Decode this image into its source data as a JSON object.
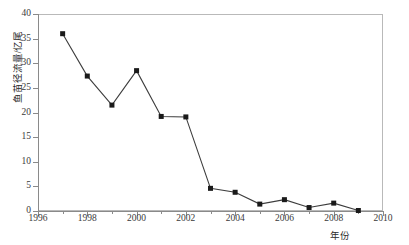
{
  "chart_data": {
    "type": "line",
    "title": "",
    "xlabel": "年份",
    "ylabel": "鱼苗径流量/亿尾",
    "xlim": [
      1996,
      2010
    ],
    "ylim": [
      0,
      40
    ],
    "grid": false,
    "legend": null,
    "marker": "square",
    "line_color": "#3d3d3d",
    "marker_color": "#1a1a1a",
    "x": [
      1997,
      1998,
      1999,
      2000,
      2001,
      2002,
      2003,
      2004,
      2005,
      2006,
      2007,
      2008,
      2009
    ],
    "values": [
      36.0,
      27.4,
      21.5,
      28.5,
      19.2,
      19.1,
      4.6,
      3.8,
      1.4,
      2.3,
      0.7,
      1.6,
      0.1
    ],
    "xticks": [
      1996,
      1998,
      2000,
      2002,
      2004,
      2006,
      2008,
      2010
    ],
    "xtick_labels": [
      "1996",
      "1998",
      "2000",
      "2002",
      "2004",
      "2006",
      "2008",
      "2010"
    ],
    "xticks_minor": [
      1997,
      1999,
      2001,
      2003,
      2005,
      2007,
      2009
    ],
    "yticks": [
      0,
      5,
      10,
      15,
      20,
      25,
      30,
      35,
      40
    ],
    "ytick_labels": [
      "0",
      "5",
      "10",
      "15",
      "20",
      "25",
      "30",
      "35",
      "40"
    ]
  }
}
